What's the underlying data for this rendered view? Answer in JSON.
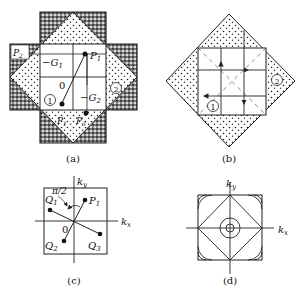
{
  "figure": {
    "panels": [
      {
        "id": "a",
        "caption": "(a)",
        "labels": {
          "p1": "P",
          "p1_sub": "1",
          "p2": "P",
          "p2_sub": "2",
          "p3": "P",
          "p3_sub": "3",
          "p1prime": "P",
          "p1prime_sub": "1",
          "p1prime_mark": "′",
          "g1": "−G",
          "g1_sub": "1",
          "g2": "−G",
          "g2_sub": "2",
          "origin": "0",
          "zone1": "1",
          "zone2": "2"
        }
      },
      {
        "id": "b",
        "caption": "(b)",
        "labels": {
          "zone1": "1",
          "zone2": "2"
        }
      },
      {
        "id": "c",
        "caption": "(c)",
        "labels": {
          "ky": "k",
          "ky_sub": "y",
          "kx": "k",
          "kx_sub": "x",
          "angle": "π/2",
          "origin": "0",
          "p1": "P",
          "p1_sub": "1",
          "q1": "Q",
          "q1_sub": "1",
          "q2": "Q",
          "q2_sub": "2",
          "q3": "Q",
          "q3_sub": "3"
        }
      },
      {
        "id": "d",
        "caption": "(d)",
        "labels": {
          "ky": "k",
          "ky_sub": "y",
          "kx": "k",
          "kx_sub": "x"
        }
      }
    ],
    "colors": {
      "line": "#222222",
      "background": "#ffffff",
      "dark_fill": "#555555"
    }
  }
}
